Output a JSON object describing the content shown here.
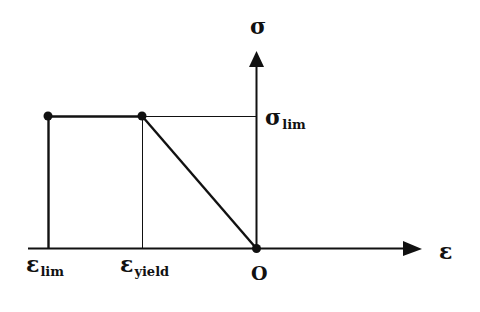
{
  "diagram": {
    "type": "stress-strain",
    "colors": {
      "ink": "#111111",
      "background": "#ffffff"
    },
    "axes": {
      "x": {
        "symbol": "ε"
      },
      "y": {
        "symbol": "σ"
      },
      "origin_label": "O"
    },
    "labels": {
      "sigma_lim": {
        "symbol": "σ",
        "subscript": "lim"
      },
      "eps_lim": {
        "symbol": "ε",
        "subscript": "lim"
      },
      "eps_yield": {
        "symbol": "ε",
        "subscript": "yield"
      }
    },
    "points": [
      {
        "name": "eps_lim_point",
        "x": 48,
        "y": 116
      },
      {
        "name": "yield_point",
        "x": 142,
        "y": 116
      },
      {
        "name": "origin",
        "x": 256,
        "y": 248
      }
    ]
  }
}
